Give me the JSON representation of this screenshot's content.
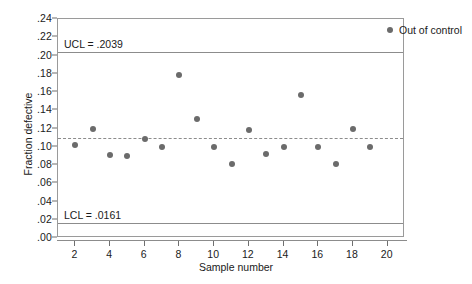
{
  "chart_data": {
    "type": "scatter",
    "title": "",
    "xlabel": "Sample number",
    "ylabel": "Fraction defective",
    "xlim": [
      1,
      21
    ],
    "ylim": [
      0.0,
      0.24
    ],
    "grid": false,
    "legend_position": "top-right",
    "x_ticks": [
      2,
      4,
      6,
      8,
      10,
      12,
      14,
      16,
      18,
      20
    ],
    "x_tick_labels": [
      "2",
      "4",
      "6",
      "8",
      "10",
      "12",
      "14",
      "16",
      "18",
      "20"
    ],
    "y_ticks": [
      0.24,
      0.22,
      0.2,
      0.18,
      0.16,
      0.14,
      0.12,
      0.1,
      0.08,
      0.06,
      0.04,
      0.02,
      0.0
    ],
    "y_tick_labels": [
      ".24",
      ".22",
      ".20",
      ".18",
      ".16",
      ".14",
      ".12",
      ".10",
      ".08",
      ".06",
      ".04",
      ".02",
      ".00"
    ],
    "legend": [
      {
        "label": "Out of control",
        "color": "#6b6b6b",
        "marker": "circle"
      }
    ],
    "annotations": [
      {
        "name": "ucl-label",
        "text": "UCL = .2039",
        "value": 0.2039
      },
      {
        "name": "lcl-label",
        "text": "LCL = .0161",
        "value": 0.0161
      }
    ],
    "reference_lines": [
      {
        "name": "upper-control-limit",
        "label": "UCL = .2039",
        "value": 0.2039,
        "style": "solid",
        "color": "#8c8c8c"
      },
      {
        "name": "center-line",
        "label": "",
        "value": 0.11,
        "style": "dashed",
        "color": "#8c8c8c"
      },
      {
        "name": "lower-control-limit",
        "label": "LCL = .0161",
        "value": 0.0161,
        "style": "solid",
        "color": "#8c8c8c"
      }
    ],
    "x": [
      2,
      3,
      4,
      5,
      6,
      7,
      8,
      9,
      10,
      11,
      12,
      13,
      14,
      15,
      16,
      17,
      18,
      19
    ],
    "values": [
      0.102,
      0.12,
      0.091,
      0.09,
      0.108,
      0.1,
      0.179,
      0.13,
      0.1,
      0.081,
      0.118,
      0.092,
      0.1,
      0.157,
      0.1,
      0.081,
      0.12,
      0.1
    ],
    "points": [
      {
        "x": 2,
        "y": 0.102
      },
      {
        "x": 3,
        "y": 0.12
      },
      {
        "x": 4,
        "y": 0.091
      },
      {
        "x": 5,
        "y": 0.09
      },
      {
        "x": 6,
        "y": 0.108
      },
      {
        "x": 7,
        "y": 0.1
      },
      {
        "x": 8,
        "y": 0.179
      },
      {
        "x": 9,
        "y": 0.13
      },
      {
        "x": 10,
        "y": 0.1
      },
      {
        "x": 11,
        "y": 0.081
      },
      {
        "x": 12,
        "y": 0.118
      },
      {
        "x": 13,
        "y": 0.092
      },
      {
        "x": 14,
        "y": 0.1
      },
      {
        "x": 15,
        "y": 0.157
      },
      {
        "x": 16,
        "y": 0.1
      },
      {
        "x": 17,
        "y": 0.081
      },
      {
        "x": 18,
        "y": 0.12
      },
      {
        "x": 19,
        "y": 0.1
      }
    ]
  }
}
